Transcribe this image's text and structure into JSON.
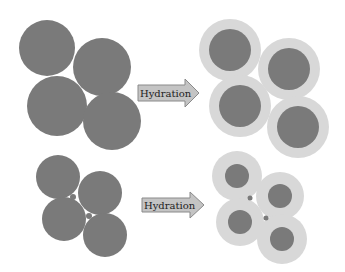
{
  "diagram": {
    "colors": {
      "particle": "#7a7a7a",
      "hydration_shell": "#d8d8d8",
      "arrow_fill": "#c4c4c4",
      "arrow_stroke": "#8a8a8a",
      "background": "#ffffff"
    },
    "rows": [
      {
        "name": "large-particles",
        "arrow_label": "Hydration",
        "before": [
          {
            "cx": 47,
            "cy": 48,
            "r": 28
          },
          {
            "cx": 102,
            "cy": 67,
            "r": 29
          },
          {
            "cx": 57,
            "cy": 106,
            "r": 30
          },
          {
            "cx": 112,
            "cy": 121,
            "r": 29
          }
        ],
        "after": [
          {
            "cx": 230,
            "cy": 50,
            "r_shell": 31,
            "r_core": 21
          },
          {
            "cx": 289,
            "cy": 69,
            "r_shell": 31,
            "r_core": 21
          },
          {
            "cx": 240,
            "cy": 106,
            "r_shell": 31,
            "r_core": 21
          },
          {
            "cx": 298,
            "cy": 127,
            "r_shell": 31,
            "r_core": 21
          }
        ]
      },
      {
        "name": "small-particles",
        "arrow_label": "Hydration",
        "before": [
          {
            "cx": 58,
            "cy": 177,
            "r": 22
          },
          {
            "cx": 100,
            "cy": 193,
            "r": 22
          },
          {
            "cx": 64,
            "cy": 219,
            "r": 22
          },
          {
            "cx": 105,
            "cy": 235,
            "r": 22
          }
        ],
        "before_fines": [
          {
            "cx": 73,
            "cy": 197,
            "r": 3
          },
          {
            "cx": 89,
            "cy": 216,
            "r": 3
          }
        ],
        "after": [
          {
            "cx": 237,
            "cy": 176,
            "r_shell": 25,
            "r_core": 12
          },
          {
            "cx": 280,
            "cy": 196,
            "r_shell": 24,
            "r_core": 12
          },
          {
            "cx": 240,
            "cy": 222,
            "r_shell": 24,
            "r_core": 12
          },
          {
            "cx": 282,
            "cy": 239,
            "r_shell": 25,
            "r_core": 12
          }
        ],
        "after_fines": [
          {
            "cx": 250,
            "cy": 198,
            "r": 2.5
          },
          {
            "cx": 266,
            "cy": 218,
            "r": 2.5
          }
        ]
      }
    ]
  }
}
